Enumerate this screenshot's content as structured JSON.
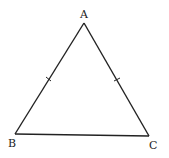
{
  "diagram": {
    "type": "isosceles-triangle",
    "vertices": {
      "A": {
        "label": "A",
        "x": 84,
        "y": 23
      },
      "B": {
        "label": "B",
        "x": 15,
        "y": 134
      },
      "C": {
        "label": "C",
        "x": 149,
        "y": 136
      }
    },
    "equal_sides": [
      "AB",
      "AC"
    ],
    "stroke_color": "#222222"
  }
}
